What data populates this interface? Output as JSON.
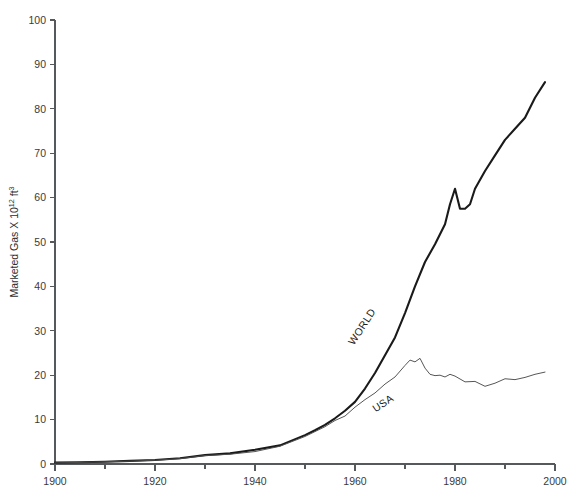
{
  "chart_data": {
    "type": "line",
    "title": "",
    "subtitle": "",
    "xlabel": "",
    "ylabel": "Marketed Gas X 10",
    "ylabel_exponent": "12",
    "ylabel_unit": "ft",
    "ylabel_unit_exponent": "3",
    "ylabel_full": "Marketed Gas X 10^12 ft^3",
    "grid": false,
    "legend_position": "inline-annotations",
    "xlim": [
      1900,
      2000
    ],
    "ylim": [
      0,
      100
    ],
    "x_major_ticks": [
      1900,
      1920,
      1940,
      1960,
      1980,
      2000
    ],
    "x_major_tick_labels": [
      "1900",
      "1920",
      "1940",
      "1960",
      "1980",
      "2000"
    ],
    "x_minor_ticks": [
      1910,
      1930,
      1950,
      1970,
      1990
    ],
    "y_ticks": [
      0,
      10,
      20,
      30,
      40,
      50,
      60,
      70,
      80,
      90,
      100
    ],
    "y_tick_labels": [
      "0",
      "10",
      "20",
      "30",
      "40",
      "50",
      "60",
      "70",
      "80",
      "90",
      "100"
    ],
    "annotations": [
      {
        "text": "WORLD",
        "x": 1962,
        "y": 30.5,
        "rotation": -57
      },
      {
        "text": "USA",
        "x": 1966,
        "y": 13.0,
        "rotation": -33
      }
    ],
    "series": [
      {
        "name": "WORLD",
        "color": "#1a1a1a",
        "x": [
          1900,
          1905,
          1910,
          1915,
          1920,
          1925,
          1930,
          1935,
          1940,
          1945,
          1950,
          1952,
          1954,
          1956,
          1958,
          1960,
          1962,
          1964,
          1966,
          1968,
          1970,
          1972,
          1974,
          1976,
          1978,
          1979,
          1980,
          1981,
          1982,
          1983,
          1984,
          1986,
          1988,
          1990,
          1992,
          1994,
          1996,
          1998
        ],
        "values": [
          0.3,
          0.4,
          0.5,
          0.7,
          0.9,
          1.3,
          2.0,
          2.4,
          3.2,
          4.2,
          6.5,
          7.6,
          8.8,
          10.3,
          12.0,
          14.0,
          17.0,
          20.5,
          24.5,
          28.5,
          34.0,
          40.0,
          45.5,
          49.5,
          54.0,
          58.5,
          62.0,
          57.5,
          57.5,
          58.5,
          62.0,
          66.0,
          69.5,
          73.0,
          75.5,
          78.0,
          82.5,
          86.0
        ]
      },
      {
        "name": "USA",
        "color": "#4d4d4d",
        "x": [
          1900,
          1905,
          1910,
          1915,
          1920,
          1925,
          1930,
          1935,
          1940,
          1945,
          1950,
          1952,
          1954,
          1956,
          1958,
          1960,
          1962,
          1964,
          1966,
          1968,
          1970,
          1971,
          1972,
          1973,
          1974,
          1975,
          1976,
          1977,
          1978,
          1979,
          1980,
          1982,
          1984,
          1986,
          1988,
          1990,
          1992,
          1994,
          1996,
          1998
        ],
        "values": [
          0.25,
          0.35,
          0.5,
          0.65,
          0.85,
          1.2,
          1.9,
          2.2,
          2.8,
          4.0,
          6.2,
          7.3,
          8.4,
          9.8,
          10.8,
          12.8,
          14.5,
          16.0,
          18.0,
          19.6,
          22.2,
          23.4,
          23.0,
          23.8,
          21.6,
          20.2,
          19.9,
          20.0,
          19.6,
          20.2,
          19.8,
          18.5,
          18.6,
          17.5,
          18.2,
          19.2,
          19.0,
          19.5,
          20.2,
          20.7
        ]
      }
    ]
  }
}
